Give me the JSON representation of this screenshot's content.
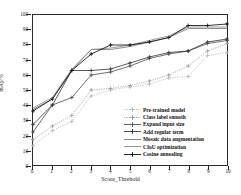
{
  "chart_data": {
    "type": "line",
    "title": "",
    "xlabel": "Score_Threhold",
    "ylabel": "mAp/%",
    "xlim": [
      0,
      10
    ],
    "ylim": [
      0,
      100
    ],
    "grid": false,
    "legend_position": "lower-right",
    "x": [
      0,
      1,
      2,
      3,
      4,
      5,
      6,
      7,
      8,
      9,
      10
    ],
    "xticks": [
      "0",
      "1",
      "2",
      "3",
      "4",
      "5",
      "6",
      "7",
      "8",
      "9",
      "10"
    ],
    "yticks": [
      "0",
      "10",
      "20",
      "30",
      "40",
      "50",
      "60",
      "70",
      "80",
      "90",
      "100"
    ],
    "series": [
      {
        "name": "Pre-trained model",
        "color": "#b9b9b9",
        "style": "dotted",
        "marker": "plus",
        "values": [
          13,
          23,
          29,
          46,
          50,
          52,
          54,
          58,
          59,
          73,
          75
        ]
      },
      {
        "name": "Class label smooth",
        "color": "#9e9e9e",
        "style": "dotted",
        "marker": "plus",
        "values": [
          17,
          26,
          33,
          50,
          51,
          53,
          56,
          60,
          66,
          76,
          81
        ]
      },
      {
        "name": "Expand input size",
        "color": "#555555",
        "style": "solid",
        "marker": "plus",
        "values": [
          22,
          40,
          45,
          60,
          62,
          66,
          71,
          74,
          76,
          81,
          83
        ]
      },
      {
        "name": "Add regular term",
        "color": "#3b3b3b",
        "style": "solid",
        "marker": "plus",
        "values": [
          27,
          40,
          63,
          63,
          64,
          68,
          72,
          75,
          76,
          82,
          84
        ]
      },
      {
        "name": "Mosaic data augmentation",
        "color": "#777777",
        "style": "solid",
        "marker": "none",
        "values": [
          37,
          44,
          63,
          77,
          77,
          79,
          82,
          85,
          91,
          91,
          91
        ]
      },
      {
        "name": "CIoU optimization",
        "color": "#8a8a8a",
        "style": "solid",
        "marker": "none",
        "values": [
          38,
          45,
          64,
          77,
          78,
          80,
          83,
          86,
          92,
          92,
          92
        ]
      },
      {
        "name": "Cosine annealing",
        "color": "#111111",
        "style": "solid",
        "marker": "plus",
        "values": [
          36,
          44,
          63,
          74,
          80,
          80,
          82,
          85,
          93,
          93,
          94
        ]
      }
    ]
  },
  "axis": {
    "x_title": "Score_Threhold",
    "y_title": "mAp/%"
  }
}
